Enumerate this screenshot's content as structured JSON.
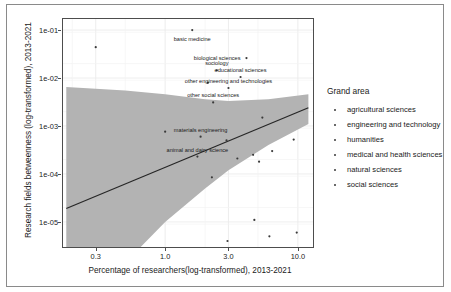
{
  "figure": {
    "background": "#ffffff",
    "panel_background": "#ffffff",
    "band_color": "#b3b3b3",
    "line_color": "#262626",
    "point_color": "#3a3a3a",
    "grid_color": "#ebebeb",
    "frame_color": "#4d4d4d"
  },
  "chart_data": {
    "type": "scatter",
    "title": "",
    "xlabel": "Percentage of researchers(log-transformed), 2013-2021",
    "ylabel": "Research fields betweenness (log-transformed), 2013-2021",
    "x_scale": "log",
    "y_scale": "log",
    "xlim": [
      0.17,
      13.0
    ],
    "ylim": [
      3e-06,
      0.17
    ],
    "xticks": [
      0.3,
      1.0,
      3.0,
      10.0
    ],
    "xticklabels": [
      "0.3",
      "1.0",
      "3.0",
      "10.0"
    ],
    "yticks": [
      0.1,
      0.01,
      0.001,
      0.0001,
      1e-05
    ],
    "yticklabels": [
      "1e-01",
      "1e-02",
      "1e-03",
      "1e-04",
      "1e-05"
    ],
    "grid": true,
    "legend_position": "right",
    "legend_title": "Grand area",
    "legend_entries": [
      "agricultural sciences",
      "engineering and technology",
      "humanities",
      "medical and health sciences",
      "natural sciences",
      "social sciences"
    ],
    "regression_line": {
      "description": "linear fit in log-log space with shaded confidence band",
      "endpoints_xy": [
        [
          0.18,
          1.9e-05
        ],
        [
          12.0,
          0.0024
        ]
      ]
    },
    "confidence_band": {
      "upper_xy": [
        [
          0.18,
          0.0065
        ],
        [
          0.5,
          0.0055
        ],
        [
          1.0,
          0.0046
        ],
        [
          2.0,
          0.0036
        ],
        [
          3.0,
          0.0033
        ],
        [
          6.0,
          0.0036
        ],
        [
          12.0,
          0.0046
        ]
      ],
      "lower_xy": [
        [
          0.18,
          5.5e-08
        ],
        [
          0.5,
          1.4e-06
        ],
        [
          1.0,
          1e-05
        ],
        [
          2.0,
          5e-05
        ],
        [
          3.0,
          0.00012
        ],
        [
          6.0,
          0.0004
        ],
        [
          12.0,
          0.0011
        ]
      ]
    },
    "points": [
      {
        "x": 0.3,
        "y": 0.044,
        "label": ""
      },
      {
        "x": 1.6,
        "y": 0.1,
        "label": "basic medicine",
        "label_dx": 0,
        "label_dy": 11,
        "label_anchor": "middle"
      },
      {
        "x": 4.1,
        "y": 0.026,
        "label": "biological sciences",
        "label_dx": -6,
        "label_dy": 2,
        "label_anchor": "end"
      },
      {
        "x": 2.45,
        "y": 0.0145,
        "label": "sociology",
        "label_dx": 0,
        "label_dy": -5,
        "label_anchor": "middle"
      },
      {
        "x": 3.7,
        "y": 0.0105,
        "label": "educational sciences",
        "label_dx": 0,
        "label_dy": -5,
        "label_anchor": "middle"
      },
      {
        "x": 2.1,
        "y": 0.008,
        "label": "",
        "label_dx": 0,
        "label_dy": 0
      },
      {
        "x": 3.0,
        "y": 0.0062,
        "label": "other engineering and technologies",
        "label_dx": 0,
        "label_dy": -5,
        "label_anchor": "middle"
      },
      {
        "x": 2.3,
        "y": 0.0031,
        "label": "other social sciences",
        "label_dx": 0,
        "label_dy": -5,
        "label_anchor": "middle"
      },
      {
        "x": 5.4,
        "y": 0.0015,
        "label": "",
        "label_dx": 0,
        "label_dy": 0
      },
      {
        "x": 1.0,
        "y": 0.00076,
        "label": "",
        "label_dx": 0,
        "label_dy": 0
      },
      {
        "x": 1.85,
        "y": 0.0006,
        "label": "materials engineering",
        "label_dx": 0,
        "label_dy": -5,
        "label_anchor": "middle"
      },
      {
        "x": 2.9,
        "y": 0.0005,
        "label": "",
        "label_dx": 0,
        "label_dy": 0
      },
      {
        "x": 1.75,
        "y": 0.00023,
        "label": "animal and dairy science",
        "label_dx": 0,
        "label_dy": -5,
        "label_anchor": "middle"
      },
      {
        "x": 3.5,
        "y": 0.00021,
        "label": "",
        "label_dx": 0,
        "label_dy": 0
      },
      {
        "x": 4.6,
        "y": 0.00025,
        "label": "",
        "label_dx": 0,
        "label_dy": 0
      },
      {
        "x": 5.1,
        "y": 0.00018,
        "label": "",
        "label_dx": 0,
        "label_dy": 0
      },
      {
        "x": 6.4,
        "y": 0.0003,
        "label": "",
        "label_dx": 0,
        "label_dy": 0
      },
      {
        "x": 9.3,
        "y": 0.00052,
        "label": "",
        "label_dx": 0,
        "label_dy": 0
      },
      {
        "x": 2.25,
        "y": 8.5e-05,
        "label": "",
        "label_dx": 0,
        "label_dy": 0
      },
      {
        "x": 4.7,
        "y": 1.1e-05,
        "label": "",
        "label_dx": 0,
        "label_dy": 0
      },
      {
        "x": 6.1,
        "y": 5e-06,
        "label": "",
        "label_dx": 0,
        "label_dy": 0
      },
      {
        "x": 9.8,
        "y": 6e-06,
        "label": "",
        "label_dx": 0,
        "label_dy": 0
      },
      {
        "x": 2.95,
        "y": 4e-06,
        "label": "",
        "label_dx": 0,
        "label_dy": 0
      }
    ]
  }
}
